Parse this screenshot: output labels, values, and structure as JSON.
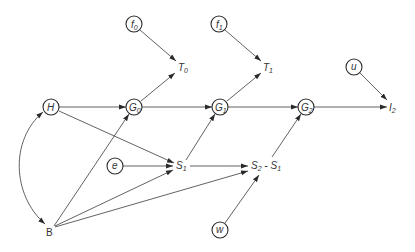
{
  "diagram": {
    "type": "path-diagram",
    "nodes": {
      "f0": {
        "main": "f",
        "sub": "0",
        "shape": "circle",
        "x": 134,
        "y": 24
      },
      "f1": {
        "main": "f",
        "sub": "1",
        "shape": "circle",
        "x": 219,
        "y": 24
      },
      "u": {
        "main": "u",
        "sub": "",
        "shape": "circle",
        "x": 354,
        "y": 67
      },
      "H": {
        "main": "H",
        "sub": "",
        "shape": "circle",
        "x": 51,
        "y": 107
      },
      "G0": {
        "main": "G",
        "sub": "0",
        "shape": "circle",
        "x": 134,
        "y": 107
      },
      "G1": {
        "main": "G",
        "sub": "1",
        "shape": "circle",
        "x": 220,
        "y": 107
      },
      "G2": {
        "main": "G",
        "sub": "2",
        "shape": "circle",
        "x": 306,
        "y": 107
      },
      "e": {
        "main": "e",
        "sub": "",
        "shape": "circle",
        "x": 115,
        "y": 166
      },
      "w": {
        "main": "w",
        "sub": "",
        "shape": "circle",
        "x": 220,
        "y": 230
      },
      "T0": {
        "main": "T",
        "sub": "0",
        "shape": "label",
        "x": 182,
        "y": 68
      },
      "T1": {
        "main": "T",
        "sub": "1",
        "shape": "label",
        "x": 267,
        "y": 68
      },
      "I2": {
        "main": "I",
        "sub": "2",
        "shape": "label",
        "x": 393,
        "y": 107
      },
      "S1": {
        "main": "S",
        "sub": "1",
        "shape": "label",
        "x": 180,
        "y": 166
      },
      "S2S1": {
        "main": "S",
        "sub": "2",
        "minus": " - ",
        "main2": "S",
        "sub2": "1",
        "shape": "label",
        "x": 268,
        "y": 166
      },
      "B": {
        "main": "B",
        "sub": "",
        "shape": "label",
        "x": 50,
        "y": 232
      }
    },
    "edges": [
      {
        "from": "f0",
        "to": "T0"
      },
      {
        "from": "G0",
        "to": "T0"
      },
      {
        "from": "f1",
        "to": "T1"
      },
      {
        "from": "G1",
        "to": "T1"
      },
      {
        "from": "u",
        "to": "I2"
      },
      {
        "from": "G2",
        "to": "I2"
      },
      {
        "from": "H",
        "to": "G0"
      },
      {
        "from": "G0",
        "to": "G1"
      },
      {
        "from": "G1",
        "to": "G2"
      },
      {
        "from": "H",
        "to": "S1"
      },
      {
        "from": "e",
        "to": "S1"
      },
      {
        "from": "S1",
        "to": "G1"
      },
      {
        "from": "S1",
        "to": "S2S1"
      },
      {
        "from": "S2S1",
        "to": "G2"
      },
      {
        "from": "w",
        "to": "S2S1"
      },
      {
        "from": "B",
        "to": "G0"
      },
      {
        "from": "B",
        "to": "S1"
      },
      {
        "from": "B",
        "to": "S2S1"
      },
      {
        "from": "H",
        "to": "B",
        "curved": true,
        "bidirectional": true
      }
    ]
  }
}
